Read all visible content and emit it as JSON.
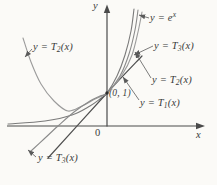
{
  "canvas": {
    "width": 217,
    "height": 185,
    "background": "#fbfaf7"
  },
  "colors": {
    "axis": "#4a4a4a",
    "text": "#3a3a3a",
    "leader": "#5a5a5a",
    "point_dot": "#2e2e2e"
  },
  "chart_data": {
    "type": "line",
    "xlabel": "x",
    "ylabel": "y",
    "origin_label": "0",
    "legend_position": "none",
    "grid": false,
    "annotated_point": {
      "label": "(0, 1)",
      "x": 0,
      "y": 1
    },
    "series": [
      {
        "name": "y = e^x",
        "color": "#7a7a7a",
        "stroke_width": 1.1,
        "path_px": [
          [
            8,
            124
          ],
          [
            45,
            121
          ],
          [
            72,
            115
          ],
          [
            90,
            106
          ],
          [
            100,
            99
          ],
          [
            107,
            93
          ],
          [
            117,
            76
          ],
          [
            125,
            55
          ],
          [
            131,
            31
          ],
          [
            134,
            9
          ]
        ]
      },
      {
        "name": "y = T1(x)",
        "color": "#4f4f4f",
        "stroke_width": 1.2,
        "path_px": [
          [
            48,
            158
          ],
          [
            107,
            93
          ],
          [
            142,
            56
          ]
        ]
      },
      {
        "name": "y = T2(x)",
        "color": "#9b9b9b",
        "stroke_width": 1.1,
        "path_px": [
          [
            23,
            38
          ],
          [
            31,
            62
          ],
          [
            41,
            84
          ],
          [
            54,
            101
          ],
          [
            68,
            111
          ],
          [
            82,
            106
          ],
          [
            95,
            99
          ],
          [
            107,
            93
          ],
          [
            122,
            75
          ],
          [
            132,
            55
          ],
          [
            138,
            32
          ],
          [
            142,
            12
          ]
        ]
      },
      {
        "name": "y = T3(x)",
        "color": "#8a8a8a",
        "stroke_width": 1.1,
        "path_px": [
          [
            31,
            151
          ],
          [
            44,
            139
          ],
          [
            58,
            126
          ],
          [
            74,
            112
          ],
          [
            90,
            101
          ],
          [
            100,
            96
          ],
          [
            107,
            93
          ],
          [
            120,
            76
          ],
          [
            129,
            54
          ],
          [
            135,
            30
          ],
          [
            138,
            10
          ]
        ]
      }
    ]
  },
  "axes": {
    "x_axis": {
      "from": [
        7,
        126
      ],
      "to": [
        197,
        126
      ],
      "arrow_tip": [
        205,
        126
      ]
    },
    "y_axis": {
      "from": [
        107,
        126.5
      ],
      "to": [
        107,
        12
      ],
      "arrow_tip": [
        107,
        4.5
      ]
    }
  },
  "point_marker": {
    "pos": [
      107,
      93
    ],
    "radius": 1.7
  },
  "labels": [
    {
      "id": "label-y-ex",
      "parts": [
        {
          "t": "y = e"
        },
        {
          "t": "x",
          "sup": true
        }
      ],
      "pos": [
        150,
        12
      ],
      "leader": {
        "from": [
          149,
          18
        ],
        "to": [
          139,
          15
        ]
      }
    },
    {
      "id": "label-y-t3-right",
      "parts": [
        {
          "t": "y = T"
        },
        {
          "t": "3",
          "sub": true
        },
        {
          "t": "(x)"
        }
      ],
      "pos": [
        154,
        40
      ],
      "leader": {
        "from": [
          153,
          46
        ],
        "to": [
          134,
          55
        ]
      }
    },
    {
      "id": "label-y-t2-right",
      "parts": [
        {
          "t": "y = T"
        },
        {
          "t": "2",
          "sub": true
        },
        {
          "t": "(x)"
        }
      ],
      "pos": [
        152,
        74
      ],
      "leader": {
        "from": [
          151,
          78
        ],
        "to": [
          135,
          52
        ]
      }
    },
    {
      "id": "label-y-t1",
      "parts": [
        {
          "t": "y = T"
        },
        {
          "t": "1",
          "sub": true
        },
        {
          "t": "(x)"
        }
      ],
      "pos": [
        140,
        97
      ],
      "leader": {
        "from": [
          139,
          100
        ],
        "to": [
          123,
          77
        ]
      }
    },
    {
      "id": "label-y-t2-left",
      "parts": [
        {
          "t": "y = T"
        },
        {
          "t": "2",
          "sub": true
        },
        {
          "t": "(x)"
        }
      ],
      "pos": [
        33,
        41
      ],
      "leader": {
        "from": [
          32,
          49
        ],
        "to": [
          25,
          57
        ]
      }
    },
    {
      "id": "label-y-t3-bottom",
      "parts": [
        {
          "t": "y = T"
        },
        {
          "t": "3",
          "sub": true
        },
        {
          "t": "(x)"
        }
      ],
      "pos": [
        38,
        152
      ],
      "leader": {
        "from": [
          36,
          157
        ],
        "to": [
          28,
          150
        ]
      }
    },
    {
      "id": "label-point-0-1",
      "parts": [
        {
          "t": "(0, 1)"
        }
      ],
      "pos": [
        109,
        88
      ],
      "small": true
    },
    {
      "id": "label-axis-y",
      "parts": [
        {
          "t": "y"
        }
      ],
      "pos": [
        93,
        0
      ]
    },
    {
      "id": "label-axis-x",
      "parts": [
        {
          "t": "x"
        }
      ],
      "pos": [
        196,
        129
      ]
    },
    {
      "id": "label-origin",
      "parts": [
        {
          "t": "0"
        }
      ],
      "pos": [
        95,
        127
      ],
      "upright": true
    }
  ]
}
